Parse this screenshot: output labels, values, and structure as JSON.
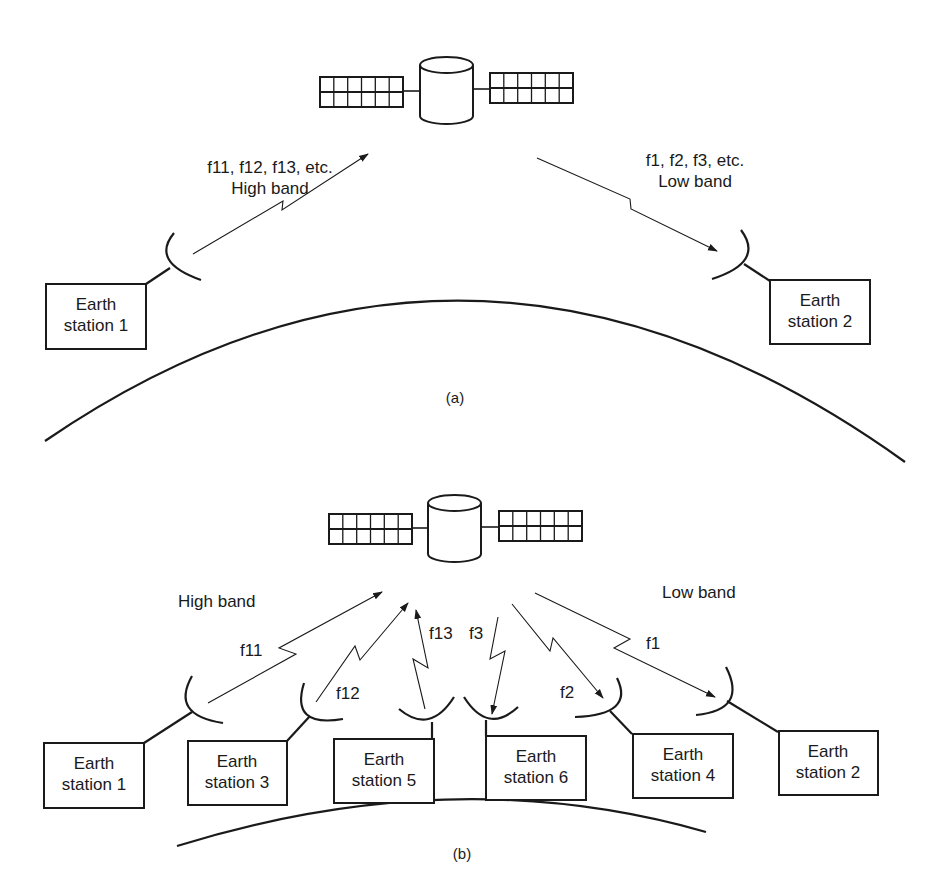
{
  "diagram": {
    "panels": [
      {
        "id": "a",
        "caption": "(a)",
        "uplink_label_line1": "f11, f12, f13, etc.",
        "uplink_label_line2": "High band",
        "downlink_label_line1": "f1, f2, f3, etc.",
        "downlink_label_line2": "Low band",
        "stations": [
          {
            "line1": "Earth",
            "line2": "station 1"
          },
          {
            "line1": "Earth",
            "line2": "station 2"
          }
        ]
      },
      {
        "id": "b",
        "caption": "(b)",
        "high_band_label": "High band",
        "low_band_label": "Low band",
        "links": [
          {
            "label": "f11",
            "direction": "up",
            "station": "Earth station 1"
          },
          {
            "label": "f12",
            "direction": "up",
            "station": "Earth station 3"
          },
          {
            "label": "f13",
            "direction": "up",
            "station": "Earth station 5"
          },
          {
            "label": "f3",
            "direction": "down",
            "station": "Earth station 6"
          },
          {
            "label": "f2",
            "direction": "down",
            "station": "Earth station 4"
          },
          {
            "label": "f1",
            "direction": "down",
            "station": "Earth station 2"
          }
        ],
        "stations": [
          {
            "line1": "Earth",
            "line2": "station 1"
          },
          {
            "line1": "Earth",
            "line2": "station 3"
          },
          {
            "line1": "Earth",
            "line2": "station 5"
          },
          {
            "line1": "Earth",
            "line2": "station 6"
          },
          {
            "line1": "Earth",
            "line2": "station 4"
          },
          {
            "line1": "Earth",
            "line2": "station 2"
          }
        ]
      }
    ],
    "colors": {
      "ink": "#1a1a1a",
      "background": "#ffffff"
    }
  }
}
